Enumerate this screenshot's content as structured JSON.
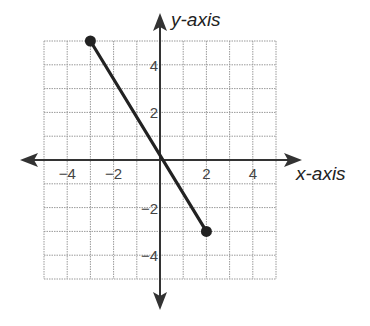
{
  "chart_data": {
    "type": "line",
    "title": "",
    "xlabel": "x-axis",
    "ylabel": "y-axis",
    "xlim": [
      -5,
      5
    ],
    "ylim": [
      -5,
      5
    ],
    "grid": true,
    "x_ticks_labeled": [
      -4,
      -2,
      2,
      4
    ],
    "y_ticks_labeled": [
      4,
      2,
      -2,
      -4
    ],
    "x_tick_labels": [
      "−4",
      "−2",
      "2",
      "4"
    ],
    "y_tick_labels": [
      "4",
      "2",
      "−2",
      "−4"
    ],
    "series": [
      {
        "name": "segment",
        "points": [
          {
            "x": -3,
            "y": 5
          },
          {
            "x": 2,
            "y": -3
          }
        ],
        "endpoints_marked": true
      }
    ],
    "colors": {
      "line": "#222222",
      "grid": "#9a9a9a",
      "axis": "#333333"
    }
  },
  "labels": {
    "x_axis": "x-axis",
    "y_axis": "y-axis",
    "x_ticks": [
      "−4",
      "−2",
      "2",
      "4"
    ],
    "y_ticks": [
      "4",
      "2",
      "−2",
      "−4"
    ]
  }
}
